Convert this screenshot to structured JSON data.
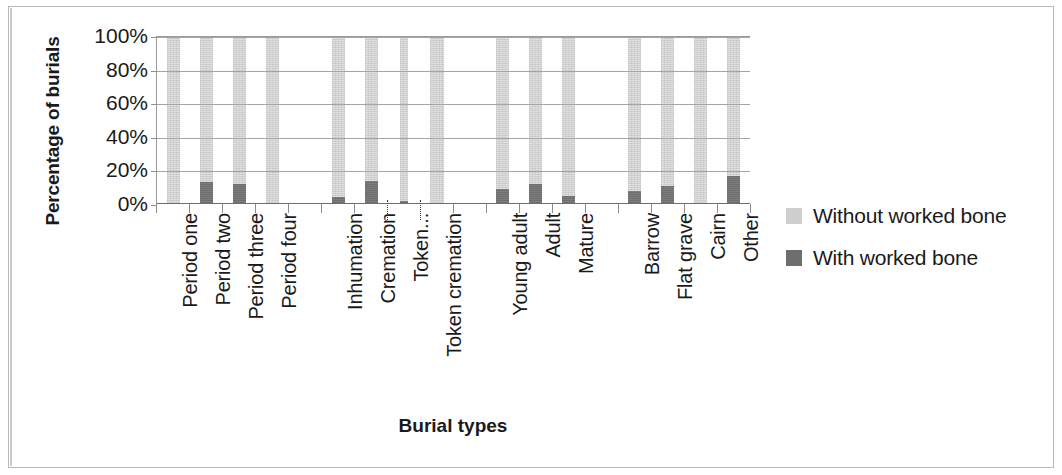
{
  "chart_data": {
    "type": "bar",
    "subtype": "100% stacked column",
    "title": "",
    "xlabel": "Burial types",
    "ylabel": "Percentage of burials",
    "ylim": [
      0,
      100
    ],
    "ytick_labels": [
      "100%",
      "80%",
      "60%",
      "40%",
      "20%",
      "0%"
    ],
    "ytick_values": [
      100,
      80,
      60,
      40,
      20,
      0
    ],
    "grid": true,
    "legend_position": "right",
    "colors": {
      "without_worked_bone": "#cfcfcf",
      "with_worked_bone": "#6e6e6e",
      "gridline": "#a5a5a5",
      "axis": "#8d8d8d",
      "text": "#1a1a1a"
    },
    "categories": [
      "Period one",
      "Period two",
      "Period three",
      "Period four",
      "",
      "Inhumation",
      "Cremation",
      "Token...",
      "Token cremation",
      "",
      "Young adult",
      "Adult",
      "Mature",
      "",
      "Barrow",
      "Flat grave",
      "Cairn",
      "Other"
    ],
    "series": [
      {
        "name": "With worked bone",
        "color": "#6e6e6e",
        "values": [
          0,
          13,
          12,
          0,
          null,
          4,
          14,
          2,
          0,
          null,
          9,
          12,
          5,
          null,
          8,
          11,
          0,
          17
        ]
      },
      {
        "name": "Without worked bone",
        "color": "#cfcfcf",
        "values": [
          100,
          87,
          88,
          100,
          null,
          96,
          86,
          98,
          100,
          null,
          91,
          88,
          95,
          null,
          92,
          89,
          100,
          83
        ]
      }
    ],
    "legend": [
      {
        "label": "Without worked bone",
        "color": "#cfcfcf",
        "swatch": "light-grey-swatch"
      },
      {
        "label": "With worked bone",
        "color": "#6e6e6e",
        "swatch": "dark-grey-swatch"
      }
    ]
  }
}
